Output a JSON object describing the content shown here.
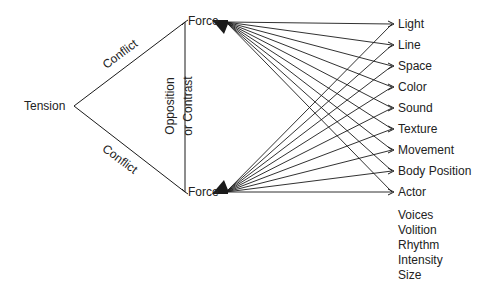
{
  "diagram": {
    "tension_label": "Tension",
    "conflict_top_label": "Conflict",
    "conflict_bottom_label": "Conflict",
    "opposition_line1": "Opposition",
    "opposition_line2": "or Contrast",
    "force_top_label": "Force",
    "force_bottom_label": "Force",
    "elements": [
      "Light",
      "Line",
      "Space",
      "Color",
      "Sound",
      "Texture",
      "Movement",
      "Body Position",
      "Actor"
    ],
    "actor_attributes": [
      "Voices",
      "Volition",
      "Rhythm",
      "Intensity",
      "Size"
    ],
    "line_color": "#1a1a1a"
  }
}
